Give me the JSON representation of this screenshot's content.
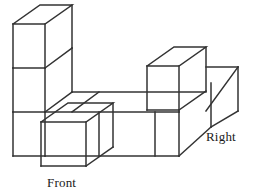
{
  "figure": {
    "kind": "isometric-cube-stack",
    "title": "",
    "labels": {
      "front": "Front",
      "right": "Right"
    },
    "colors": {
      "background": "#ffffff",
      "stroke": "#333333",
      "face_fill": "none",
      "text": "#1a1a1a"
    },
    "stroke_width": 1.5,
    "projection": {
      "cube_width": 44,
      "cube_height": 44,
      "depth_dx": 27,
      "depth_dy": -19
    },
    "geometry": {
      "polylines": [
        {
          "name": "left-tower-top-face",
          "points": "13,24 40,5 72,5 72,5 45,24 13,24"
        },
        {
          "name": "left-tower-top-back-right",
          "points": "72,5 72,48"
        },
        {
          "name": "left-tower-top-front-right",
          "points": "45,24 45,68"
        },
        {
          "name": "left-tower-top-left",
          "points": "13,24 13,68"
        },
        {
          "name": "left-tower-top-bottom",
          "points": "13,68 45,68"
        },
        {
          "name": "left-tower-mid-right-depth",
          "points": "45,68 72,48"
        },
        {
          "name": "left-tower-mid-left",
          "points": "13,68 13,112"
        },
        {
          "name": "left-tower-mid-right",
          "points": "45,68 45,112"
        },
        {
          "name": "left-tower-mid-bottom",
          "points": "13,112 45,112"
        },
        {
          "name": "left-tower-mid-depth",
          "points": "45,112 72,92"
        },
        {
          "name": "left-tower-vertical-back",
          "points": "72,48 72,92"
        },
        {
          "name": "left-tower-bottom-left",
          "points": "13,112 13,156"
        },
        {
          "name": "left-tower-bottom-right",
          "points": "45,112 45,156"
        },
        {
          "name": "left-tower-bottom-bottom",
          "points": "13,156 45,156"
        },
        {
          "name": "top-row-back-face",
          "points": "72,92 156,92"
        },
        {
          "name": "deck-top-edge",
          "points": "72,92 99,92"
        },
        {
          "name": "deck-front-top",
          "points": "45,112 155,112"
        },
        {
          "name": "deck-diagonal-a",
          "points": "99,92 72,112"
        },
        {
          "name": "row-face-divider-1",
          "points": "99,112 99,156"
        },
        {
          "name": "row-face-divider-2",
          "points": "155,112 155,156"
        },
        {
          "name": "bottom-base-front",
          "points": "45,156 155,156"
        },
        {
          "name": "front-cube-top-face",
          "points": "41,122 68,103 113,103 86,122 41,122"
        },
        {
          "name": "front-cube-left",
          "points": "41,122 41,166"
        },
        {
          "name": "front-cube-right",
          "points": "86,122 86,166"
        },
        {
          "name": "front-cube-bottom",
          "points": "41,166 86,166"
        },
        {
          "name": "front-cube-depth-right",
          "points": "86,166 113,147"
        },
        {
          "name": "front-cube-back-right-vert",
          "points": "113,103 113,147"
        },
        {
          "name": "raised-cube-top-face",
          "points": "147,66 174,47 206,47 206,47 179,66 147,66"
        },
        {
          "name": "raised-cube-left",
          "points": "147,66 147,110"
        },
        {
          "name": "raised-cube-right",
          "points": "179,66 179,110"
        },
        {
          "name": "raised-cube-bottom",
          "points": "147,110 179,110"
        },
        {
          "name": "raised-cube-depth-right",
          "points": "179,110 206,91"
        },
        {
          "name": "raised-cube-back-vert",
          "points": "206,47 206,91"
        },
        {
          "name": "back-right-cube-top",
          "points": "206,67 238,67"
        },
        {
          "name": "back-right-cube-left-vert",
          "points": "206,67 206,111"
        },
        {
          "name": "back-right-cube-right-vert",
          "points": "238,67 238,111"
        },
        {
          "name": "back-right-cube-diag-top",
          "points": "206,111 238,67"
        },
        {
          "name": "back-right-cube-inner-vert",
          "points": "216,82 216,126"
        },
        {
          "name": "right-front-slab-top",
          "points": "179,110 206,91"
        },
        {
          "name": "right-slab-diag",
          "points": "179,154 211,111"
        },
        {
          "name": "right-slab-right-vert",
          "points": "238,111 238,111"
        },
        {
          "name": "bottom-right-diag",
          "points": "155,156 182,137"
        },
        {
          "name": "right-end-face-bottom",
          "points": "182,137 211,137"
        }
      ]
    }
  }
}
